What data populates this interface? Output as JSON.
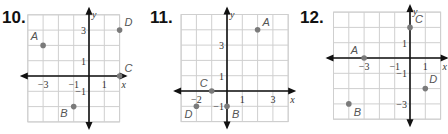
{
  "problems": [
    {
      "number": "10.",
      "x_label": "x",
      "y_label": "y",
      "grid": {
        "xmin": -4,
        "xmax": 2,
        "ymin": -3,
        "ymax": 4
      },
      "ticks_x": [
        {
          "v": -3,
          "t": "−3"
        },
        {
          "v": -1,
          "t": "−1"
        },
        {
          "v": 1,
          "t": "1"
        }
      ],
      "ticks_y": [
        {
          "v": 3,
          "t": "3"
        },
        {
          "v": 1,
          "t": "1"
        },
        {
          "v": -1,
          "t": "−1"
        }
      ],
      "points": [
        {
          "label": "A",
          "x": -3,
          "y": 2
        },
        {
          "label": "B",
          "x": -1,
          "y": -2
        },
        {
          "label": "C",
          "x": 2,
          "y": 0
        },
        {
          "label": "D",
          "x": 2,
          "y": 3
        }
      ]
    },
    {
      "number": "11.",
      "x_label": "x",
      "y_label": "y",
      "grid": {
        "xmin": -3,
        "xmax": 4,
        "ymin": -2,
        "ymax": 5
      },
      "ticks_x": [
        {
          "v": -2,
          "t": "−2"
        },
        {
          "v": 1,
          "t": "1"
        },
        {
          "v": 3,
          "t": "3"
        }
      ],
      "ticks_y": [
        {
          "v": 3,
          "t": "3"
        },
        {
          "v": 1,
          "t": "1"
        },
        {
          "v": -1,
          "t": "−1"
        }
      ],
      "points": [
        {
          "label": "A",
          "x": 2,
          "y": 4
        },
        {
          "label": "B",
          "x": 0,
          "y": -1
        },
        {
          "label": "C",
          "x": -1,
          "y": 0
        },
        {
          "label": "D",
          "x": -2,
          "y": -1
        }
      ]
    },
    {
      "number": "12.",
      "x_label": "x",
      "y_label": "y",
      "grid": {
        "xmin": -5,
        "xmax": 2,
        "ymin": -4,
        "ymax": 3
      },
      "ticks_x": [
        {
          "v": -3,
          "t": "−3"
        },
        {
          "v": -1,
          "t": "−1"
        },
        {
          "v": 1,
          "t": "1"
        }
      ],
      "ticks_y": [
        {
          "v": 1,
          "t": "1"
        },
        {
          "v": -1,
          "t": "−1"
        },
        {
          "v": -3,
          "t": "−3"
        }
      ],
      "points": [
        {
          "label": "A",
          "x": -3,
          "y": 0
        },
        {
          "label": "B",
          "x": -4,
          "y": -3
        },
        {
          "label": "C",
          "x": 0,
          "y": 2
        },
        {
          "label": "D",
          "x": 1,
          "y": -2
        }
      ]
    }
  ],
  "colors": {
    "grid": "#cfcfcf",
    "axis": "#111111",
    "point": "#7a7a7a",
    "label": "#555555"
  }
}
